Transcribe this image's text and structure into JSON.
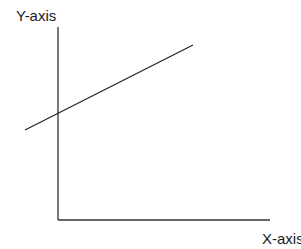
{
  "diagram": {
    "type": "coordinate-axes-with-line",
    "y_axis_label": "Y-axis",
    "x_axis_label": "X-axis",
    "colors": {
      "axis": "#333333",
      "line": "#222222",
      "background": "#ffffff",
      "text": "#1a1a1a"
    },
    "geometry": {
      "origin": {
        "x": 58,
        "y": 220
      },
      "y_axis_top": {
        "x": 58,
        "y": 27
      },
      "x_axis_right": {
        "x": 270,
        "y": 220
      },
      "line_start": {
        "x": 25,
        "y": 130
      },
      "line_end": {
        "x": 193,
        "y": 45
      },
      "y_intercept": {
        "x": 58,
        "y": 113
      }
    }
  }
}
